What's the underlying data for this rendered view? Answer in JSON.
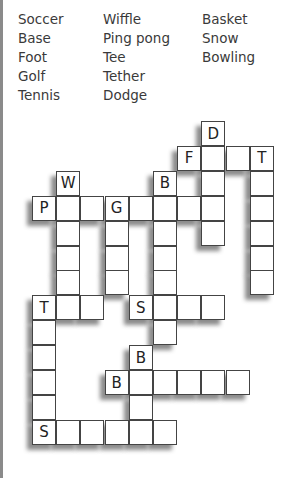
{
  "word_bank": {
    "columns": [
      [
        "Soccer",
        "Base",
        "Foot",
        "Golf",
        "Tennis"
      ],
      [
        "Wiffle",
        "Ping pong",
        "Tee",
        "Tether",
        "Dodge"
      ],
      [
        "Basket",
        "Snow",
        "Bowling"
      ]
    ]
  },
  "crossword": {
    "origin": {
      "x": 32,
      "y": 121
    },
    "cell_w": 24.2,
    "cell_h": 24.9,
    "words": [
      {
        "word": "DODGE",
        "dir": "down",
        "col": 7,
        "row": 0,
        "clue_letter": "D"
      },
      {
        "word": "FOOT",
        "dir": "across",
        "col": 6,
        "row": 1,
        "clue_letter": "F"
      },
      {
        "word": "TETHER",
        "dir": "down",
        "col": 9,
        "row": 1,
        "clue_letter": "T"
      },
      {
        "word": "WIFFLE",
        "dir": "down",
        "col": 1,
        "row": 2,
        "clue_letter": "W"
      },
      {
        "word": "BOWLING",
        "dir": "down",
        "col": 5,
        "row": 2,
        "clue_letter": "B"
      },
      {
        "word": "PINGPONG",
        "dir": "across",
        "col": 0,
        "row": 3,
        "clue_letter": "P"
      },
      {
        "word": "GOLF",
        "dir": "down",
        "col": 3,
        "row": 3,
        "clue_letter": "G"
      },
      {
        "word": "TEE",
        "dir": "across",
        "col": 0,
        "row": 7,
        "clue_letter": "T"
      },
      {
        "word": "TENNIS",
        "dir": "down",
        "col": 0,
        "row": 7,
        "clue_letter": "T"
      },
      {
        "word": "SNOW",
        "dir": "across",
        "col": 4,
        "row": 7,
        "clue_letter": "S"
      },
      {
        "word": "BASE",
        "dir": "down",
        "col": 4,
        "row": 9,
        "clue_letter": "B"
      },
      {
        "word": "BASKET",
        "dir": "across",
        "col": 3,
        "row": 10,
        "clue_letter": "B"
      },
      {
        "word": "SOCCER",
        "dir": "across",
        "col": 0,
        "row": 12,
        "clue_letter": "S"
      }
    ]
  }
}
